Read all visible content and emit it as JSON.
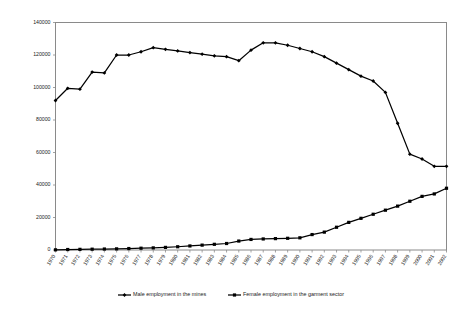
{
  "chart_data": {
    "type": "line",
    "title": "",
    "subtitle": "",
    "xlabel": "",
    "ylabel": "",
    "grid": false,
    "legend_position": "bottom",
    "xlim": [
      1970,
      2002
    ],
    "ylim": [
      0,
      140000
    ],
    "ytick_values": [
      0,
      20000,
      40000,
      60000,
      80000,
      100000,
      120000,
      140000
    ],
    "ytick_labels": [
      "0",
      "20000",
      "40000",
      "60000",
      "80000",
      "100000",
      "120000",
      "140000"
    ],
    "categories": [
      "1970",
      "1971",
      "1972",
      "1973",
      "1974",
      "1975",
      "1976",
      "1977",
      "1978",
      "1979",
      "1980",
      "1981",
      "1982",
      "1983",
      "1984",
      "1985",
      "1986",
      "1987",
      "1988",
      "1989",
      "1990",
      "1991",
      "1992",
      "1993",
      "1994",
      "1995",
      "1996",
      "1997",
      "1998",
      "1999",
      "2000",
      "2001",
      "2002"
    ],
    "x": [
      1970,
      1971,
      1972,
      1973,
      1974,
      1975,
      1976,
      1977,
      1978,
      1979,
      1980,
      1981,
      1982,
      1983,
      1984,
      1985,
      1986,
      1987,
      1988,
      1989,
      1990,
      1991,
      1992,
      1993,
      1994,
      1995,
      1996,
      1997,
      1998,
      1999,
      2000,
      2001,
      2002
    ],
    "series": [
      {
        "name": "Male employment in the mines",
        "marker": "diamond",
        "color": "#000000",
        "values": [
          92000,
          99500,
          99000,
          109500,
          109000,
          120000,
          120000,
          122000,
          124500,
          123500,
          122500,
          121500,
          120500,
          119500,
          119000,
          116500,
          123000,
          127500,
          127500,
          126000,
          124000,
          122000,
          119000,
          115000,
          111000,
          107000,
          104000,
          97000,
          78000,
          59000,
          56000,
          51500,
          51500
        ]
      },
      {
        "name": "Female employment in the garment sector",
        "marker": "square",
        "color": "#000000",
        "values": [
          100,
          300,
          400,
          500,
          600,
          700,
          900,
          1100,
          1300,
          1600,
          2000,
          2500,
          3000,
          3500,
          4000,
          5500,
          6500,
          6800,
          7000,
          7200,
          7500,
          9500,
          11000,
          14000,
          17000,
          19500,
          22000,
          24500,
          27000,
          30000,
          33000,
          34500,
          38000
        ]
      }
    ],
    "legend": [
      "Male employment in the mines",
      "Female employment in the garment sector"
    ]
  }
}
